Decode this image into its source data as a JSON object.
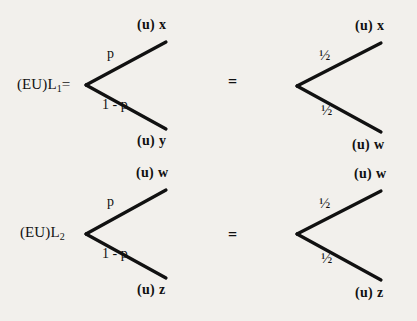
{
  "canvas": {
    "width": 417,
    "height": 321,
    "background": "#f2f0ec",
    "ink": "#111111"
  },
  "diagram": {
    "type": "decision-tree-pair",
    "rows": [
      {
        "id": "row-1",
        "left": {
          "root_label": "(EU)L",
          "root_subscript": "1",
          "root_suffix": "=",
          "branches": [
            {
              "probability": "p",
              "outcome_prefix": "(u)",
              "outcome_var": "x"
            },
            {
              "probability": "1 - p",
              "outcome_prefix": "(u)",
              "outcome_var": "y"
            }
          ]
        },
        "operator": "=",
        "right": {
          "root_label": "",
          "root_subscript": "",
          "root_suffix": "",
          "branches": [
            {
              "probability": "½",
              "outcome_prefix": "(u)",
              "outcome_var": "x"
            },
            {
              "probability": "½",
              "outcome_prefix": "(u)",
              "outcome_var": "w"
            }
          ]
        }
      },
      {
        "id": "row-2",
        "left": {
          "root_label": "(EU)L",
          "root_subscript": "2",
          "root_suffix": "",
          "branches": [
            {
              "probability": "p",
              "outcome_prefix": "(u)",
              "outcome_var": "w"
            },
            {
              "probability": "1 - p",
              "outcome_prefix": "(u)",
              "outcome_var": "z"
            }
          ]
        },
        "operator": "=",
        "right": {
          "root_label": "",
          "root_subscript": "",
          "root_suffix": "",
          "branches": [
            {
              "probability": "½",
              "outcome_prefix": "(u)",
              "outcome_var": "w"
            },
            {
              "probability": "½",
              "outcome_prefix": "(u)",
              "outcome_var": "z"
            }
          ]
        }
      }
    ]
  }
}
